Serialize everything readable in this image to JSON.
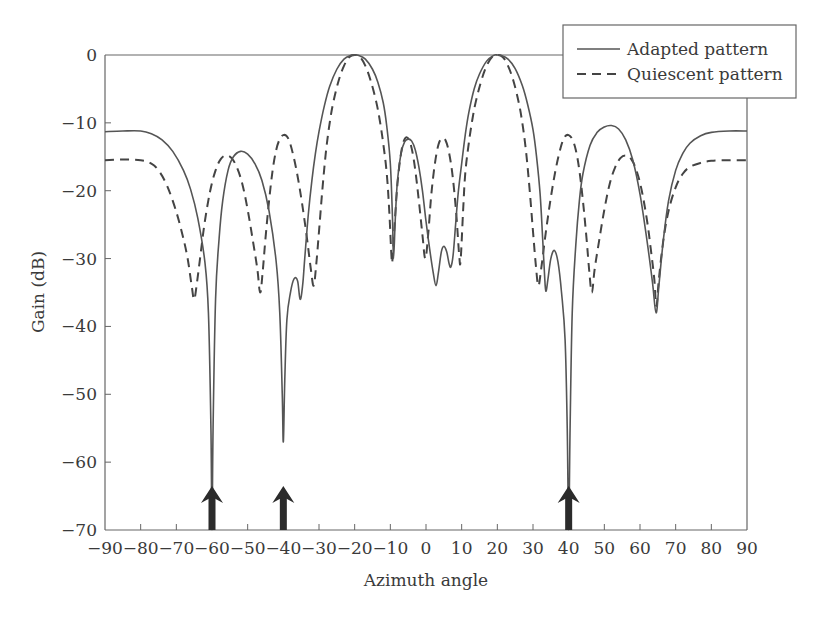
{
  "chart_data": {
    "type": "line",
    "title": "",
    "xlabel": "Azimuth angle",
    "ylabel": "Gain (dB)",
    "xlim": [
      -90,
      90
    ],
    "ylim": [
      -70,
      0
    ],
    "xticks": [
      -90,
      -80,
      -70,
      -60,
      -50,
      -40,
      -30,
      -20,
      -10,
      0,
      10,
      20,
      30,
      40,
      50,
      60,
      70,
      80,
      90
    ],
    "yticks": [
      0,
      -10,
      -20,
      -30,
      -40,
      -50,
      -60,
      -70
    ],
    "xtick_labels": [
      "−90",
      "−80",
      "−70",
      "−60",
      "−50",
      "−40",
      "−30",
      "−20",
      "−10",
      "0",
      "10",
      "20",
      "30",
      "40",
      "50",
      "60",
      "70",
      "80",
      "90"
    ],
    "ytick_labels": [
      "0",
      "−10",
      "−20",
      "−30",
      "−40",
      "−50",
      "−60",
      "−70"
    ],
    "grid": false,
    "legend_position": "upper right (outside top-right corner)",
    "legend": [
      "Adapted pattern",
      "Quiescent pattern"
    ],
    "series": [
      {
        "name": "Adapted pattern",
        "style": "solid",
        "points": [
          [
            -90,
            -11.3
          ],
          [
            -85,
            -11.2
          ],
          [
            -80,
            -11.2
          ],
          [
            -77,
            -11.6
          ],
          [
            -74,
            -12.5
          ],
          [
            -71,
            -14.2
          ],
          [
            -68,
            -17.0
          ],
          [
            -66,
            -19.8
          ],
          [
            -64,
            -24.0
          ],
          [
            -62,
            -30.5
          ],
          [
            -61,
            -38.0
          ],
          [
            -60.3,
            -55.0
          ],
          [
            -60,
            -70.0
          ],
          [
            -59.7,
            -55.0
          ],
          [
            -59,
            -36.0
          ],
          [
            -58,
            -27.0
          ],
          [
            -57,
            -21.5
          ],
          [
            -55.5,
            -17.0
          ],
          [
            -54,
            -15.0
          ],
          [
            -52,
            -14.2
          ],
          [
            -50,
            -14.6
          ],
          [
            -48,
            -16.0
          ],
          [
            -46,
            -18.5
          ],
          [
            -44,
            -23.0
          ],
          [
            -42,
            -30.5
          ],
          [
            -41,
            -38.0
          ],
          [
            -40.3,
            -50.0
          ],
          [
            -40,
            -57.0
          ],
          [
            -39.6,
            -48.0
          ],
          [
            -39,
            -39.0
          ],
          [
            -38,
            -35.0
          ],
          [
            -37,
            -33.0
          ],
          [
            -36,
            -33.3
          ],
          [
            -35.3,
            -36.0
          ],
          [
            -34.6,
            -34.0
          ],
          [
            -34,
            -30.0
          ],
          [
            -33,
            -23.5
          ],
          [
            -32,
            -18.5
          ],
          [
            -31,
            -14.5
          ],
          [
            -30,
            -11.3
          ],
          [
            -28.5,
            -7.5
          ],
          [
            -27,
            -4.6
          ],
          [
            -25,
            -2.1
          ],
          [
            -23,
            -0.6
          ],
          [
            -21,
            -0.05
          ],
          [
            -20,
            0
          ],
          [
            -19,
            -0.05
          ],
          [
            -17,
            -0.6
          ],
          [
            -15,
            -2.1
          ],
          [
            -13.5,
            -4.0
          ],
          [
            -12,
            -7.0
          ],
          [
            -11,
            -10.5
          ],
          [
            -10,
            -16.0
          ],
          [
            -9.4,
            -24.0
          ],
          [
            -9.1,
            -30.0
          ],
          [
            -8.6,
            -24.0
          ],
          [
            -8,
            -18.5
          ],
          [
            -7,
            -14.5
          ],
          [
            -6,
            -12.8
          ],
          [
            -5,
            -12.4
          ],
          [
            -4,
            -12.7
          ],
          [
            -3,
            -14.0
          ],
          [
            -2,
            -16.5
          ],
          [
            -1,
            -20.0
          ],
          [
            0,
            -24.5
          ],
          [
            1,
            -28.5
          ],
          [
            2,
            -32.0
          ],
          [
            2.8,
            -34.0
          ],
          [
            3.5,
            -32.0
          ],
          [
            4.3,
            -29.0
          ],
          [
            5,
            -28.2
          ],
          [
            5.8,
            -29.0
          ],
          [
            6.5,
            -30.8
          ],
          [
            7,
            -31.2
          ],
          [
            7.6,
            -29.5
          ],
          [
            8.3,
            -25.0
          ],
          [
            9,
            -20.5
          ],
          [
            10,
            -16.0
          ],
          [
            11,
            -11.8
          ],
          [
            12,
            -8.5
          ],
          [
            13.5,
            -5.0
          ],
          [
            15,
            -2.8
          ],
          [
            17,
            -0.9
          ],
          [
            19,
            -0.05
          ],
          [
            20,
            0
          ],
          [
            21,
            -0.05
          ],
          [
            23,
            -0.6
          ],
          [
            25,
            -2.0
          ],
          [
            27,
            -4.5
          ],
          [
            28.5,
            -7.3
          ],
          [
            30,
            -11.0
          ],
          [
            31,
            -15.0
          ],
          [
            32,
            -20.5
          ],
          [
            32.7,
            -27.0
          ],
          [
            33.2,
            -32.0
          ],
          [
            33.6,
            -34.8
          ],
          [
            34.2,
            -33.0
          ],
          [
            35,
            -30.0
          ],
          [
            36,
            -28.8
          ],
          [
            37,
            -30.5
          ],
          [
            38,
            -35.0
          ],
          [
            39,
            -42.0
          ],
          [
            39.6,
            -55.0
          ],
          [
            40,
            -70.0
          ],
          [
            40.4,
            -55.0
          ],
          [
            41,
            -38.0
          ],
          [
            42,
            -28.0
          ],
          [
            43,
            -21.5
          ],
          [
            44,
            -17.5
          ],
          [
            46,
            -13.3
          ],
          [
            48,
            -11.4
          ],
          [
            50,
            -10.6
          ],
          [
            52,
            -10.4
          ],
          [
            54,
            -10.9
          ],
          [
            56,
            -12.5
          ],
          [
            58,
            -15.5
          ],
          [
            60,
            -20.5
          ],
          [
            62,
            -27.5
          ],
          [
            63.5,
            -33.5
          ],
          [
            64.5,
            -38.0
          ],
          [
            65.3,
            -34.0
          ],
          [
            66.5,
            -27.5
          ],
          [
            68,
            -21.5
          ],
          [
            70,
            -17.0
          ],
          [
            72,
            -14.5
          ],
          [
            74,
            -13.0
          ],
          [
            77,
            -11.9
          ],
          [
            80,
            -11.4
          ],
          [
            85,
            -11.2
          ],
          [
            90,
            -11.2
          ]
        ]
      },
      {
        "name": "Quiescent pattern",
        "style": "dashed",
        "points": [
          [
            -90,
            -15.5
          ],
          [
            -85,
            -15.4
          ],
          [
            -80,
            -15.5
          ],
          [
            -77,
            -16.0
          ],
          [
            -75,
            -17.0
          ],
          [
            -73,
            -18.8
          ],
          [
            -71,
            -21.5
          ],
          [
            -69,
            -25.0
          ],
          [
            -67,
            -29.5
          ],
          [
            -65.7,
            -34.0
          ],
          [
            -65,
            -36.0
          ],
          [
            -64.2,
            -33.5
          ],
          [
            -63,
            -28.5
          ],
          [
            -62,
            -24.5
          ],
          [
            -60.5,
            -20.0
          ],
          [
            -59,
            -17.0
          ],
          [
            -57.5,
            -15.3
          ],
          [
            -56,
            -14.8
          ],
          [
            -54.5,
            -15.2
          ],
          [
            -53,
            -16.6
          ],
          [
            -51.5,
            -19.0
          ],
          [
            -50,
            -22.8
          ],
          [
            -48.5,
            -27.5
          ],
          [
            -47.3,
            -31.5
          ],
          [
            -46.5,
            -35.0
          ],
          [
            -45.8,
            -32.0
          ],
          [
            -45,
            -27.0
          ],
          [
            -44,
            -21.5
          ],
          [
            -43,
            -17.0
          ],
          [
            -42,
            -14.0
          ],
          [
            -41,
            -12.4
          ],
          [
            -40,
            -11.8
          ],
          [
            -39,
            -12.0
          ],
          [
            -38,
            -13.2
          ],
          [
            -36.5,
            -16.5
          ],
          [
            -35,
            -21.0
          ],
          [
            -33.5,
            -26.5
          ],
          [
            -32.3,
            -31.5
          ],
          [
            -31.5,
            -34.0
          ],
          [
            -30.8,
            -31.0
          ],
          [
            -30,
            -26.0
          ],
          [
            -29,
            -19.5
          ],
          [
            -28,
            -14.0
          ],
          [
            -27,
            -10.0
          ],
          [
            -26,
            -7.0
          ],
          [
            -24.5,
            -3.8
          ],
          [
            -23,
            -1.6
          ],
          [
            -21.5,
            -0.3
          ],
          [
            -20,
            0
          ],
          [
            -18.5,
            -0.3
          ],
          [
            -17,
            -1.6
          ],
          [
            -15.5,
            -3.8
          ],
          [
            -14,
            -6.8
          ],
          [
            -13,
            -9.5
          ],
          [
            -12,
            -13.0
          ],
          [
            -11,
            -17.5
          ],
          [
            -10.3,
            -23.0
          ],
          [
            -9.7,
            -29.5
          ],
          [
            -9.4,
            -30.2
          ],
          [
            -8.8,
            -25.0
          ],
          [
            -8,
            -19.0
          ],
          [
            -7,
            -14.5
          ],
          [
            -6,
            -12.4
          ],
          [
            -5,
            -12.3
          ],
          [
            -4,
            -13.8
          ],
          [
            -3,
            -17.0
          ],
          [
            -2,
            -21.5
          ],
          [
            -1,
            -26.5
          ],
          [
            -0.2,
            -30.0
          ],
          [
            0.6,
            -26.5
          ],
          [
            1.5,
            -20.5
          ],
          [
            2.5,
            -16.0
          ],
          [
            3.5,
            -13.2
          ],
          [
            4.5,
            -12.3
          ],
          [
            5.5,
            -12.6
          ],
          [
            6.5,
            -14.5
          ],
          [
            7.5,
            -18.0
          ],
          [
            8.5,
            -23.5
          ],
          [
            9.3,
            -29.5
          ],
          [
            9.7,
            -30.3
          ],
          [
            10.4,
            -23.0
          ],
          [
            11,
            -17.5
          ],
          [
            12,
            -13.0
          ],
          [
            13,
            -9.5
          ],
          [
            14,
            -6.8
          ],
          [
            15.5,
            -3.8
          ],
          [
            17,
            -1.6
          ],
          [
            18.5,
            -0.3
          ],
          [
            20,
            0
          ],
          [
            21.5,
            -0.3
          ],
          [
            23,
            -1.6
          ],
          [
            24.5,
            -3.8
          ],
          [
            26,
            -7.0
          ],
          [
            27,
            -10.0
          ],
          [
            28,
            -14.0
          ],
          [
            29,
            -19.5
          ],
          [
            30,
            -26.0
          ],
          [
            30.8,
            -31.0
          ],
          [
            31.5,
            -34.0
          ],
          [
            32.3,
            -31.5
          ],
          [
            33.5,
            -26.5
          ],
          [
            35,
            -21.0
          ],
          [
            36.5,
            -16.5
          ],
          [
            38,
            -13.2
          ],
          [
            39,
            -12.0
          ],
          [
            40,
            -11.8
          ],
          [
            41,
            -12.4
          ],
          [
            42,
            -14.0
          ],
          [
            43,
            -17.0
          ],
          [
            44,
            -21.5
          ],
          [
            45,
            -27.0
          ],
          [
            45.8,
            -32.0
          ],
          [
            46.5,
            -35.0
          ],
          [
            47.3,
            -31.5
          ],
          [
            48.5,
            -27.5
          ],
          [
            50,
            -22.8
          ],
          [
            51.5,
            -19.0
          ],
          [
            53,
            -16.6
          ],
          [
            54.5,
            -15.2
          ],
          [
            56,
            -14.8
          ],
          [
            57.5,
            -15.3
          ],
          [
            59,
            -17.0
          ],
          [
            60.5,
            -20.0
          ],
          [
            62,
            -24.5
          ],
          [
            63,
            -28.5
          ],
          [
            64,
            -33.0
          ],
          [
            64.6,
            -37.0
          ],
          [
            65.3,
            -33.0
          ],
          [
            66.5,
            -27.5
          ],
          [
            68,
            -23.0
          ],
          [
            70,
            -19.5
          ],
          [
            72,
            -17.5
          ],
          [
            74,
            -16.5
          ],
          [
            77,
            -15.9
          ],
          [
            80,
            -15.6
          ],
          [
            85,
            -15.5
          ],
          [
            90,
            -15.5
          ]
        ]
      }
    ],
    "annotations": [
      {
        "type": "arrow",
        "x": -60,
        "label": "jammer direction",
        "from_db": -70,
        "to_db": -63.5
      },
      {
        "type": "arrow",
        "x": -40,
        "label": "jammer direction",
        "from_db": -70,
        "to_db": -63.5
      },
      {
        "type": "arrow",
        "x": 40,
        "label": "jammer direction",
        "from_db": -70,
        "to_db": -63.5
      }
    ]
  },
  "colors": {
    "adapted_line": "#555555",
    "quiescent_line": "#444444",
    "axis": "#666666",
    "arrow": "#2b2b2b",
    "text": "#3a3a3a"
  }
}
